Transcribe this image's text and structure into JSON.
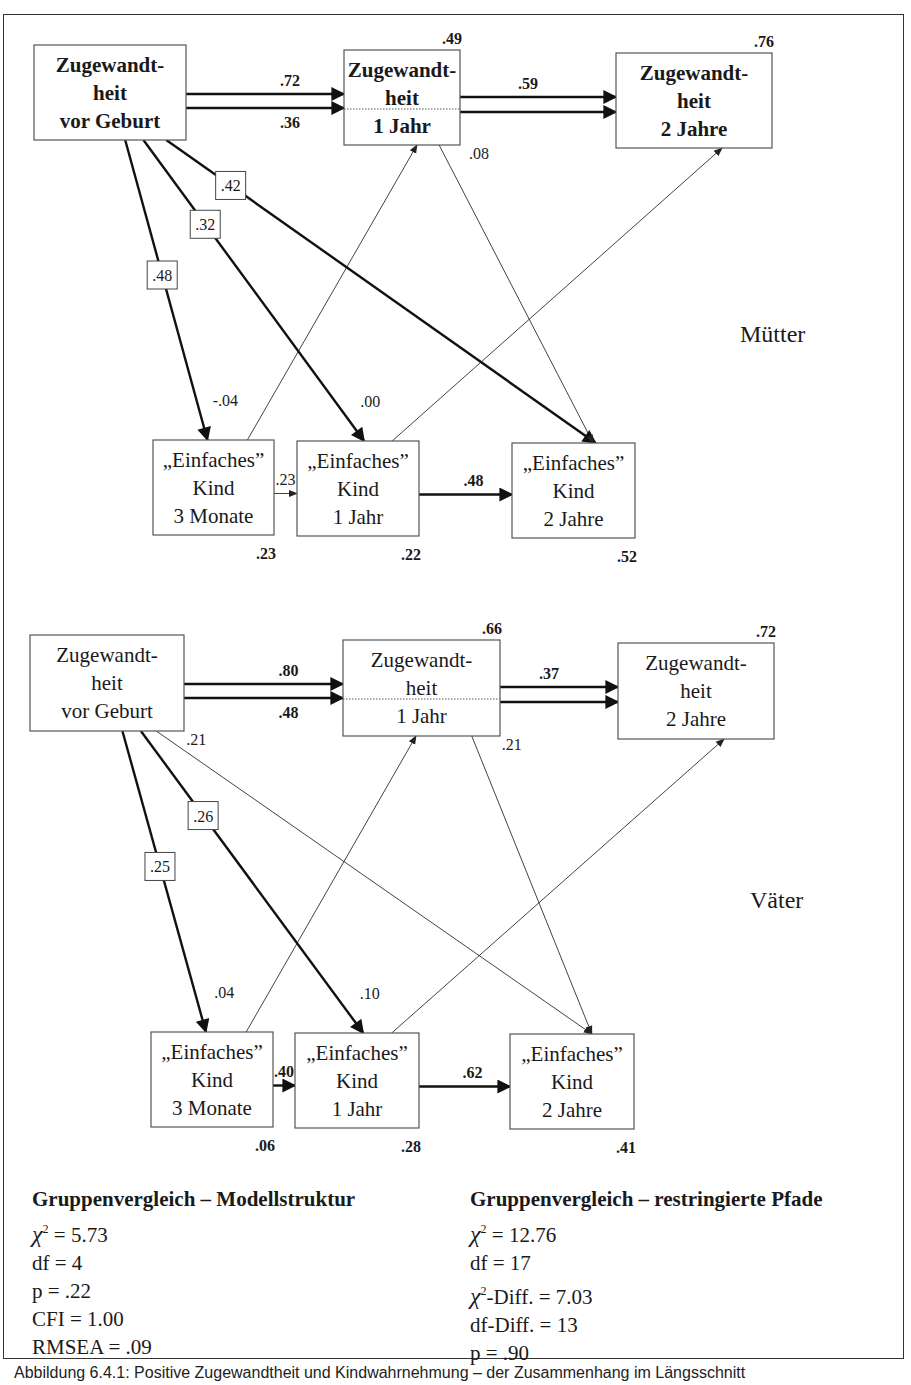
{
  "figure": {
    "groups": [
      {
        "label": "Mütter",
        "label_pos": [
          740,
          342
        ],
        "nodes": [
          {
            "id": "Z0",
            "lines": [
              "Zugewandt-",
              "heit",
              "vor Geburt"
            ],
            "bold": true,
            "x": 34,
            "y": 45,
            "w": 152,
            "h": 95
          },
          {
            "id": "Z1",
            "lines": [
              "Zugewandt-",
              "heit",
              "1 Jahr"
            ],
            "bold": true,
            "x": 344,
            "y": 50,
            "w": 116,
            "h": 95,
            "divider": true,
            "r2": ".49"
          },
          {
            "id": "Z2",
            "lines": [
              "Zugewandt-",
              "heit",
              "2 Jahre"
            ],
            "bold": true,
            "x": 616,
            "y": 53,
            "w": 156,
            "h": 95,
            "r2": ".76"
          },
          {
            "id": "E0",
            "lines": [
              "„Einfaches”",
              "Kind",
              "3 Monate"
            ],
            "bold": false,
            "x": 153,
            "y": 440,
            "w": 121,
            "h": 95,
            "r2": ".23"
          },
          {
            "id": "E1",
            "lines": [
              "„Einfaches”",
              "Kind",
              "1 Jahr"
            ],
            "bold": false,
            "x": 297,
            "y": 441,
            "w": 122,
            "h": 95,
            "r2": ".22"
          },
          {
            "id": "E2",
            "lines": [
              "„Einfaches”",
              "Kind",
              "2 Jahre"
            ],
            "bold": false,
            "x": 512,
            "y": 443,
            "w": 123,
            "h": 95,
            "r2": ".52"
          }
        ],
        "paths": [
          {
            "from": "Z0",
            "to": "Z1",
            "value": ".72",
            "weight": "bold",
            "kind": "stability-top"
          },
          {
            "from": "Z0",
            "to": "Z1",
            "value": ".36",
            "weight": "bold",
            "kind": "stability-bottom"
          },
          {
            "from": "Z1",
            "to": "Z2",
            "value": ".59",
            "weight": "bold",
            "kind": "stability-double"
          },
          {
            "from": "Z0",
            "to": "E0",
            "value": ".48",
            "weight": "bold",
            "boxed": true
          },
          {
            "from": "Z0",
            "to": "E1",
            "value": ".32",
            "weight": "bold",
            "boxed": true
          },
          {
            "from": "Z0",
            "to": "E2",
            "value": ".42",
            "weight": "bold",
            "boxed": true
          },
          {
            "from": "E0",
            "to": "Z1",
            "value": "-.04",
            "weight": "thin"
          },
          {
            "from": "E1",
            "to": "Z2",
            "value": ".00",
            "weight": "thin"
          },
          {
            "from": "Z1",
            "to": "E2",
            "value": ".08",
            "weight": "thin"
          },
          {
            "from": "E0",
            "to": "E1",
            "value": ".23",
            "weight": "thin"
          },
          {
            "from": "E1",
            "to": "E2",
            "value": ".48",
            "weight": "bold"
          }
        ]
      },
      {
        "label": "Väter",
        "label_pos": [
          750,
          908
        ],
        "nodes": [
          {
            "id": "Z0",
            "lines": [
              "Zugewandt-",
              "heit",
              "vor Geburt"
            ],
            "bold": false,
            "x": 30,
            "y": 635,
            "w": 154,
            "h": 96
          },
          {
            "id": "Z1",
            "lines": [
              "Zugewandt-",
              "heit",
              "1 Jahr"
            ],
            "bold": false,
            "x": 343,
            "y": 640,
            "w": 157,
            "h": 96,
            "divider": true,
            "r2": ".66"
          },
          {
            "id": "Z2",
            "lines": [
              "Zugewandt-",
              "heit",
              "2 Jahre"
            ],
            "bold": false,
            "x": 618,
            "y": 643,
            "w": 156,
            "h": 96,
            "r2": ".72"
          },
          {
            "id": "E0",
            "lines": [
              "„Einfaches”",
              "Kind",
              "3 Monate"
            ],
            "bold": false,
            "x": 151,
            "y": 1032,
            "w": 122,
            "h": 95,
            "r2": ".06"
          },
          {
            "id": "E1",
            "lines": [
              "„Einfaches”",
              "Kind",
              "1 Jahr"
            ],
            "bold": false,
            "x": 295,
            "y": 1033,
            "w": 124,
            "h": 95,
            "r2": ".28"
          },
          {
            "id": "E2",
            "lines": [
              "„Einfaches”",
              "Kind",
              "2 Jahre"
            ],
            "bold": false,
            "x": 510,
            "y": 1034,
            "w": 124,
            "h": 95,
            "r2": ".41"
          }
        ],
        "paths": [
          {
            "from": "Z0",
            "to": "Z1",
            "value": ".80",
            "weight": "bold",
            "kind": "stability-top"
          },
          {
            "from": "Z0",
            "to": "Z1",
            "value": ".48",
            "weight": "bold",
            "kind": "stability-bottom"
          },
          {
            "from": "Z1",
            "to": "Z2",
            "value": ".37",
            "weight": "bold",
            "kind": "stability-double"
          },
          {
            "from": "Z0",
            "to": "E0",
            "value": ".25",
            "weight": "bold",
            "boxed": true
          },
          {
            "from": "Z0",
            "to": "E1",
            "value": ".26",
            "weight": "bold",
            "boxed": true
          },
          {
            "from": "Z0",
            "to": "E2",
            "value": ".21",
            "weight": "thin"
          },
          {
            "from": "E0",
            "to": "Z1",
            "value": ".04",
            "weight": "thin"
          },
          {
            "from": "E1",
            "to": "Z2",
            "value": ".10",
            "weight": "thin"
          },
          {
            "from": "Z1",
            "to": "E2",
            "value": ".21",
            "weight": "thin"
          },
          {
            "from": "E0",
            "to": "E1",
            "value": ".40",
            "weight": "bold"
          },
          {
            "from": "E1",
            "to": "E2",
            "value": ".62",
            "weight": "bold"
          }
        ]
      }
    ]
  },
  "stats": {
    "left": {
      "title": "Gruppenvergleich – Modellstruktur",
      "lines": [
        {
          "chi": true,
          "text": " = 5.73"
        },
        {
          "chi": false,
          "text": "df = 4"
        },
        {
          "chi": false,
          "text": "p = .22"
        },
        {
          "chi": false,
          "text": "CFI = 1.00"
        },
        {
          "chi": false,
          "text": "RMSEA = .09"
        }
      ]
    },
    "right": {
      "title": "Gruppenvergleich – restringierte Pfade",
      "lines": [
        {
          "chi": true,
          "text": " = 12.76"
        },
        {
          "chi": false,
          "text": "df = 17"
        },
        {
          "chi": true,
          "text": "-Diff. = 7.03"
        },
        {
          "chi": false,
          "text": "df-Diff. = 13"
        },
        {
          "chi": false,
          "text": "p = .90"
        }
      ]
    }
  },
  "caption": "Abbildung 6.4.1: Positive Zugewandtheit und Kindwahrnehmung – der Zusammenhang im Längsschnitt"
}
